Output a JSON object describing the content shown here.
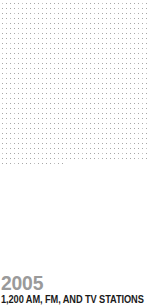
{
  "chart_data": {
    "type": "pictogram",
    "title": "2005",
    "subtitle": "1,200 AM, FM, AND TV STATIONS",
    "unit_icon": "broadcast-tower-icon",
    "icon_value": 1,
    "total_value": 1200,
    "icon_count": 1200,
    "categories": [
      "AM, FM, and TV stations"
    ],
    "values": [
      1200
    ],
    "grid": {
      "columns": 37,
      "rows": 33,
      "icon_width_px": 4,
      "icon_height_px": 5
    },
    "colors": {
      "icon_fill": "#a8a8a8",
      "icon_fill_alt": "#c4c4c4",
      "year_text": "#9a9a9a",
      "caption_text": "#1a1a1a",
      "background": "#ffffff"
    },
    "xlabel": "",
    "ylabel": "",
    "legend": [],
    "grid_lines": false
  },
  "infographic": {
    "year": "2005",
    "caption": "1,200 AM, FM, AND TV STATIONS"
  }
}
